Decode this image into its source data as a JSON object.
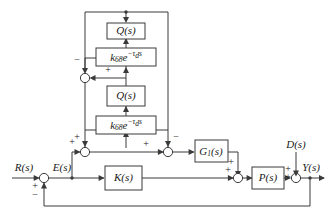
{
  "diagram": {
    "background_color": "#ffffff",
    "line_color": "#3a3a3a",
    "text_color": "#1a1a1a"
  },
  "signals": {
    "reference": "R(s)",
    "error": "E(s)",
    "disturbance": "D(s)",
    "output": "Y(s)"
  },
  "blocks": {
    "q_top": "Q(s)",
    "delay_top_base": "k",
    "delay_top_sub": "68",
    "delay_top_exp_e": "e",
    "delay_top_exp": "−τ",
    "delay_top_exp_sub": "d",
    "delay_top_exp_s": "s",
    "q_mid": "Q(s)",
    "delay_mid_base": "k",
    "delay_mid_sub": "68",
    "delay_mid_exp_e": "e",
    "delay_mid_exp": "−τ",
    "delay_mid_exp_sub": "d",
    "delay_mid_exp_s": "s",
    "g1": "G",
    "g1_sub": "1",
    "g1_paren": "(s)",
    "k_controller": "K(s)",
    "plant": "P(s)"
  },
  "signs": {
    "sum_main_plus": "+",
    "sum_main_minus": "−",
    "sum_inner_minus": "−",
    "sum_inner_plus": "+",
    "sum_left_plus_in": "+",
    "sum_left_plus_top": "+",
    "sum_mid_plus": "+",
    "sum_right_minus": "−",
    "sum_plant_plus_left": "+",
    "sum_plant_plus_top": "+",
    "sum_out_plus_top": "+",
    "sum_out_plus_left": "+"
  }
}
